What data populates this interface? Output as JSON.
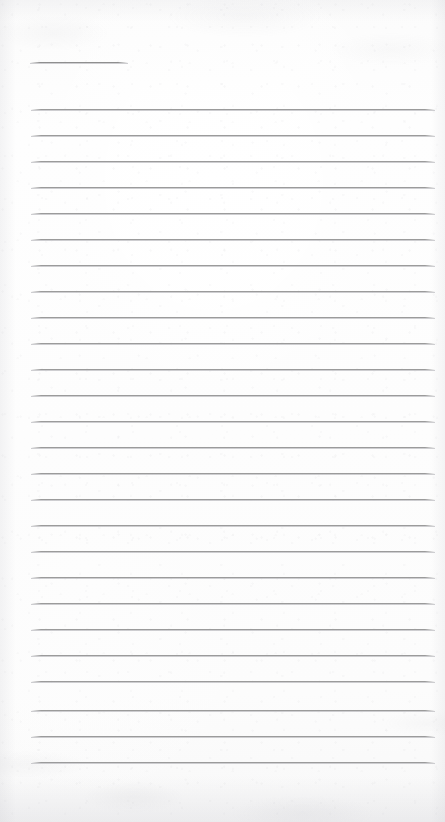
{
  "document": {
    "kind": "ruled-notepaper-scan",
    "title_text": "",
    "body_text": "",
    "width_px": 445,
    "height_px": 822
  },
  "colors": {
    "page_background": "#fdfdfd",
    "rule_line": "#9b9b9b",
    "rule_line_highlight": "#bebec1",
    "header_rule_line": "#8f8f8f",
    "edge_shadow": "#cdcdd2"
  },
  "ruling": {
    "left_margin_px": 31,
    "right_edge_px": 435,
    "line_spacing_px": 26,
    "header_rule": {
      "x": 30,
      "y": 62,
      "width": 98
    },
    "body_rules": [
      {
        "y": 109
      },
      {
        "y": 135
      },
      {
        "y": 161
      },
      {
        "y": 187
      },
      {
        "y": 213
      },
      {
        "y": 239
      },
      {
        "y": 265
      },
      {
        "y": 291
      },
      {
        "y": 317
      },
      {
        "y": 343
      },
      {
        "y": 369
      },
      {
        "y": 395
      },
      {
        "y": 421
      },
      {
        "y": 447
      },
      {
        "y": 473
      },
      {
        "y": 499
      },
      {
        "y": 525
      },
      {
        "y": 551
      },
      {
        "y": 577
      },
      {
        "y": 603
      },
      {
        "y": 629
      },
      {
        "y": 655
      },
      {
        "y": 681
      },
      {
        "y": 710
      },
      {
        "y": 736
      },
      {
        "y": 762
      }
    ]
  }
}
